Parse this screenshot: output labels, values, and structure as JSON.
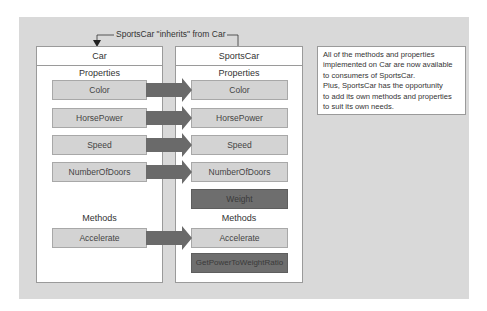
{
  "connector": {
    "label": "SportsCar \"inherits\" from Car"
  },
  "car": {
    "title": "Car",
    "properties_label": "Properties",
    "properties": [
      "Color",
      "HorsePower",
      "Speed",
      "NumberOfDoors"
    ],
    "methods_label": "Methods",
    "methods": [
      "Accelerate"
    ]
  },
  "sportscar": {
    "title": "SportsCar",
    "properties_label": "Properties",
    "properties": [
      "Color",
      "HorsePower",
      "Speed",
      "NumberOfDoors"
    ],
    "new_properties": [
      "Weight"
    ],
    "methods_label": "Methods",
    "methods": [
      "Accelerate"
    ],
    "new_methods": [
      "GetPowerToWeightRatio"
    ]
  },
  "callout": {
    "lines": [
      "All of the methods and properties",
      "implemented on Car are now available",
      "to consumers of SportsCar.",
      "Plus, SportsCar has the opportunity",
      "to add its own methods and properties",
      "to suit its own needs."
    ]
  },
  "colors": {
    "background": "#d9d9d9",
    "inherited_member": "#d3d3d3",
    "new_member": "#6e6e6e",
    "arrow": "#6a6a6a"
  }
}
